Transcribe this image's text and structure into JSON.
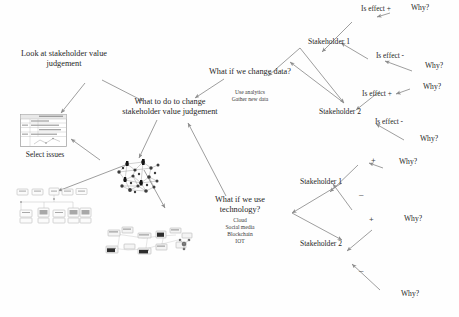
{
  "diagram": {
    "background_color": "#fefefe",
    "ink_color": "#262626",
    "edge_color": "#8a8a8a",
    "nodes": {
      "look_at": "Look at stakeholder value judgement",
      "select_issues": "Select issues",
      "center": "What to do to change stakeholder value judgement",
      "change_data": {
        "title": "What if we change data?",
        "items": [
          "Use analytics",
          "Gather new data"
        ]
      },
      "use_technology": {
        "title": "What if we use technology?",
        "items": [
          "Cloud",
          "Social media",
          "Blockchain",
          "IOT"
        ]
      }
    },
    "upper_branch": {
      "stakeholder_1": "Stakeholder 1",
      "stakeholder_2": "Stakeholder 2",
      "effect_pos_1": "Is effect +",
      "effect_neg_1": "Is effect -",
      "effect_pos_2": "Is effect +",
      "effect_neg_2": "Is effect -",
      "why_1": "Why?",
      "why_2": "Why?",
      "why_3": "Why?",
      "why_4": "Why?"
    },
    "lower_branch": {
      "stakeholder_1": "Stakeholder 1",
      "stakeholder_2": "Stakeholder 2",
      "sign_pos_1": "+",
      "sign_neg_1": "–",
      "sign_pos_2": "+",
      "sign_neg_2": "–",
      "why_1": "Why?",
      "why_2": "Why?",
      "why_3": "Why?"
    },
    "thumbnails": {
      "issues_table": "issues-table-thumbnail",
      "boxes_diagram": "boxes-diagram-thumbnail",
      "network_cluster": "network-cluster-thumbnail",
      "scatter_map": "scatter-map-thumbnail"
    }
  }
}
